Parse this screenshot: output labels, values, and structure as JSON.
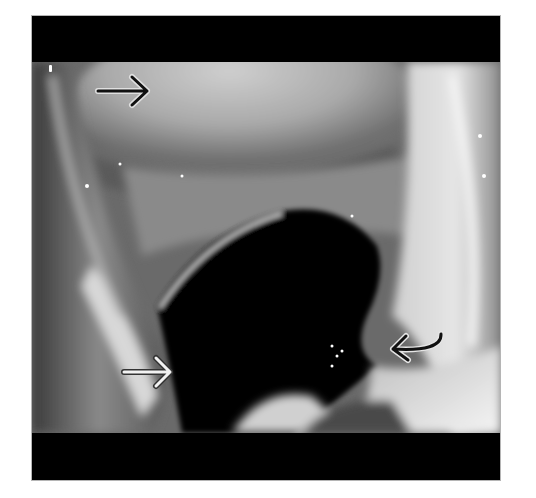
{
  "figure": {
    "type": "endoscopic-grayscale-image",
    "colors": {
      "frame_band": "#000000",
      "background": "#ffffff",
      "arrow_dark": "#111111",
      "arrow_light": "#f2f2f2"
    },
    "bands": {
      "top": {
        "y_start": 16,
        "y_end": 62
      },
      "bottom": {
        "y_start": 433,
        "y_end": 480
      }
    },
    "annotations": [
      {
        "id": "arrow-top-left",
        "style": "black-straight",
        "direction": "right",
        "tail": [
          98,
          91
        ],
        "head": [
          147,
          91
        ]
      },
      {
        "id": "arrow-bottom-left",
        "style": "white-straight",
        "direction": "right",
        "tail": [
          124,
          372
        ],
        "head": [
          170,
          372
        ]
      },
      {
        "id": "arrow-bottom-right",
        "style": "black-curved",
        "direction": "left",
        "tail": [
          441,
          336
        ],
        "head": [
          393,
          349
        ]
      }
    ]
  }
}
